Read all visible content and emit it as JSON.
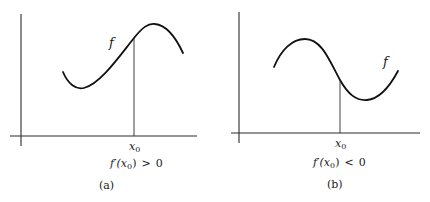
{
  "figure": {
    "panels": [
      {
        "id": "a",
        "curve_label": "f",
        "point_label": "x",
        "point_subscript": "0",
        "condition": {
          "prefix": "f′(x",
          "subscript": "0",
          "suffix": ")",
          "relation": ">",
          "value": "0"
        },
        "caption": "(a)",
        "slope_sign": "positive"
      },
      {
        "id": "b",
        "curve_label": "f",
        "point_label": "x",
        "point_subscript": "0",
        "condition": {
          "prefix": "f′(x",
          "subscript": "0",
          "suffix": ")",
          "relation": "<",
          "value": "0"
        },
        "caption": "(b)",
        "slope_sign": "negative"
      }
    ]
  }
}
